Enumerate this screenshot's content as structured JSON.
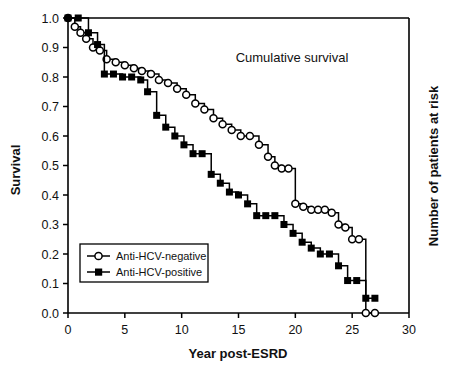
{
  "chart_data": {
    "type": "line",
    "title": "Cumulative survival",
    "xlabel": "Year post-ESRD",
    "ylabel": "Survival",
    "ylabel_right": "Number of patients at risk",
    "xlim": [
      0,
      30
    ],
    "ylim": [
      0.0,
      1.0
    ],
    "xticks": [
      0,
      5,
      10,
      15,
      20,
      25,
      30
    ],
    "xtick_labels": [
      "0",
      "5",
      "10",
      "15",
      "20",
      "25",
      "30"
    ],
    "yticks": [
      0.0,
      0.1,
      0.2,
      0.3,
      0.4,
      0.5,
      0.6,
      0.7,
      0.8,
      0.9,
      1.0
    ],
    "ytick_labels": [
      "0.0",
      "0.1",
      "0.2",
      "0.3",
      "0.4",
      "0.5",
      "0.6",
      "0.7",
      "0.8",
      "0.9",
      "1.0"
    ],
    "grid": false,
    "legend_position": "lower-left",
    "step": true,
    "series": [
      {
        "name": "Anti-HCV-negative",
        "marker": "open-circle",
        "color": "#000000",
        "points": [
          [
            0.0,
            1.0
          ],
          [
            0.6,
            0.97
          ],
          [
            1.1,
            0.95
          ],
          [
            1.6,
            0.93
          ],
          [
            2.2,
            0.9
          ],
          [
            2.8,
            0.89
          ],
          [
            3.4,
            0.86
          ],
          [
            4.2,
            0.85
          ],
          [
            5.0,
            0.84
          ],
          [
            5.8,
            0.83
          ],
          [
            6.5,
            0.82
          ],
          [
            7.3,
            0.81
          ],
          [
            8.0,
            0.79
          ],
          [
            8.8,
            0.78
          ],
          [
            9.6,
            0.76
          ],
          [
            10.4,
            0.74
          ],
          [
            11.2,
            0.71
          ],
          [
            12.0,
            0.69
          ],
          [
            12.8,
            0.66
          ],
          [
            13.6,
            0.64
          ],
          [
            14.4,
            0.62
          ],
          [
            15.2,
            0.6
          ],
          [
            16.0,
            0.6
          ],
          [
            16.8,
            0.57
          ],
          [
            17.6,
            0.53
          ],
          [
            18.2,
            0.5
          ],
          [
            18.8,
            0.49
          ],
          [
            19.4,
            0.49
          ],
          [
            20.0,
            0.37
          ],
          [
            20.7,
            0.36
          ],
          [
            21.4,
            0.35
          ],
          [
            22.0,
            0.35
          ],
          [
            22.6,
            0.35
          ],
          [
            23.2,
            0.34
          ],
          [
            23.8,
            0.3
          ],
          [
            24.4,
            0.29
          ],
          [
            25.0,
            0.25
          ],
          [
            25.6,
            0.25
          ],
          [
            26.2,
            0.0
          ],
          [
            27.0,
            0.0
          ]
        ]
      },
      {
        "name": "Anti-HCV-positive",
        "marker": "filled-square",
        "color": "#000000",
        "points": [
          [
            0.0,
            1.0
          ],
          [
            0.9,
            1.0
          ],
          [
            1.8,
            0.95
          ],
          [
            2.6,
            0.91
          ],
          [
            3.2,
            0.81
          ],
          [
            4.0,
            0.81
          ],
          [
            4.8,
            0.8
          ],
          [
            5.6,
            0.8
          ],
          [
            6.4,
            0.79
          ],
          [
            7.0,
            0.75
          ],
          [
            7.8,
            0.67
          ],
          [
            8.6,
            0.63
          ],
          [
            9.4,
            0.6
          ],
          [
            10.2,
            0.57
          ],
          [
            11.0,
            0.54
          ],
          [
            11.8,
            0.54
          ],
          [
            12.6,
            0.47
          ],
          [
            13.4,
            0.44
          ],
          [
            14.2,
            0.41
          ],
          [
            15.0,
            0.4
          ],
          [
            15.8,
            0.37
          ],
          [
            16.6,
            0.33
          ],
          [
            17.4,
            0.33
          ],
          [
            18.2,
            0.33
          ],
          [
            19.0,
            0.3
          ],
          [
            19.8,
            0.27
          ],
          [
            20.6,
            0.24
          ],
          [
            21.4,
            0.22
          ],
          [
            22.2,
            0.2
          ],
          [
            23.0,
            0.2
          ],
          [
            23.8,
            0.16
          ],
          [
            24.6,
            0.11
          ],
          [
            25.4,
            0.11
          ],
          [
            26.2,
            0.05
          ],
          [
            27.0,
            0.05
          ]
        ]
      }
    ]
  },
  "legend": {
    "entries": [
      {
        "label": "Anti-HCV-negative",
        "marker": "open-circle"
      },
      {
        "label": "Anti-HCV-positive",
        "marker": "filled-square"
      }
    ]
  }
}
